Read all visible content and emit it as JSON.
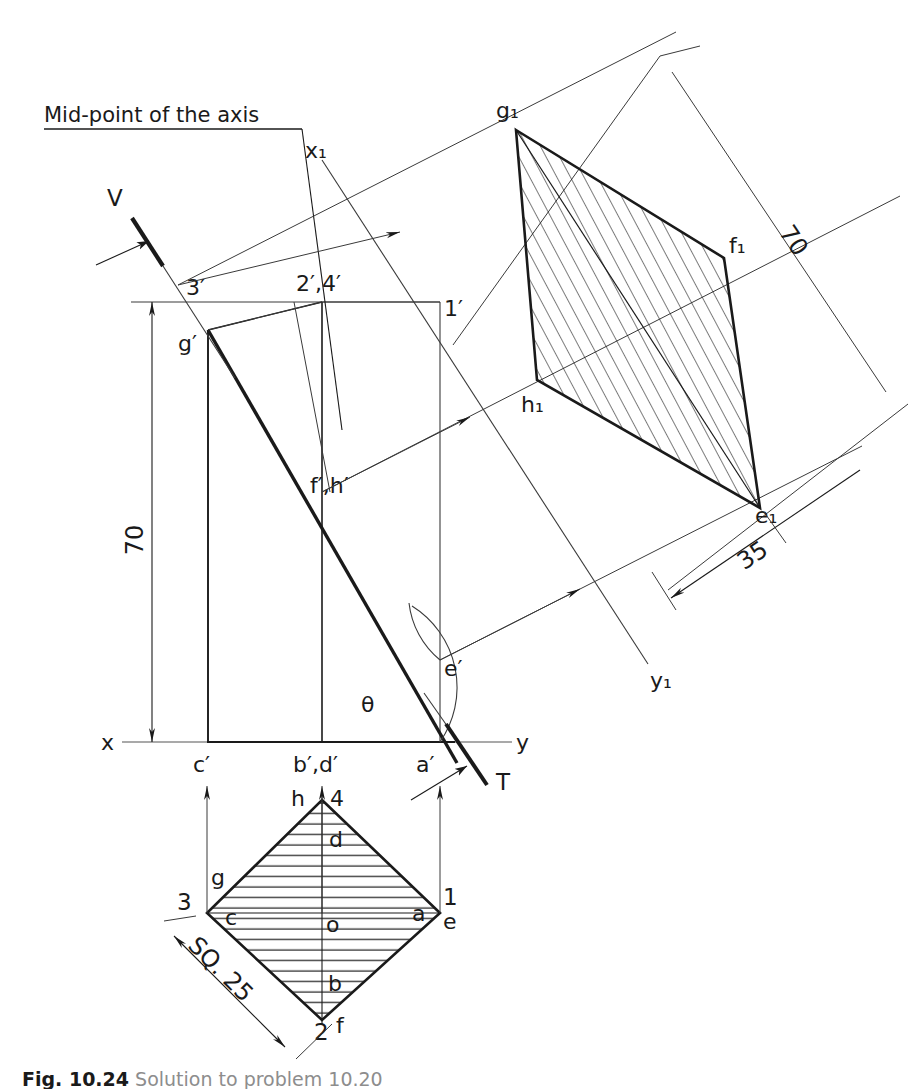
{
  "figure": {
    "caption_number": "Fig. 10.24",
    "caption_text": "Solution to problem 10.20"
  },
  "annotations": {
    "midpoint_note": "Mid-point of the axis",
    "vertical_trace_label": "V",
    "horizontal_trace_label": "T",
    "theta_label": "θ",
    "aux_axis_x1": "x₁",
    "aux_axis_y1": "y₁",
    "ground_line_x": "x",
    "ground_line_y": "y"
  },
  "dimensions": {
    "height_front": "70",
    "height_aux": "70",
    "offset_aux": "35",
    "square_side": "SQ. 25"
  },
  "front_view": {
    "name": "front-view",
    "labels": {
      "top_left": "3′",
      "top_mid": "2′,4′",
      "top_right": "1′",
      "g_prime": "g′",
      "fh_prime": "f′,h′",
      "e_prime": "e′",
      "c_prime": "c′",
      "bd_prime": "b′,d′",
      "a_prime": "a′"
    }
  },
  "top_view": {
    "name": "top-view",
    "labels": {
      "corner_top_num": "4",
      "corner_top_letter": "h",
      "corner_left_num": "3",
      "corner_left_letter": "g",
      "corner_right_num": "1",
      "corner_right_letter": "e",
      "corner_bottom_num": "2",
      "corner_bottom_letter": "f",
      "inner_top": "d",
      "inner_left": "c",
      "inner_right": "a",
      "inner_bottom": "b",
      "centre": "o"
    }
  },
  "auxiliary_view": {
    "name": "auxiliary-view",
    "labels": {
      "g1": "g₁",
      "f1": "f₁",
      "h1": "h₁",
      "e1": "e₁"
    }
  },
  "colors": {
    "line": "#1a1a1a",
    "thin_line": "#3a3a3a",
    "hatch": "#1a1a1a",
    "caption_grey": "#8d8d8d",
    "background": "#ffffff"
  }
}
